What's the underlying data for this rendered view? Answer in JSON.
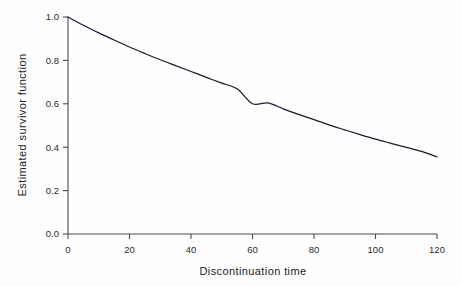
{
  "chart_data": {
    "type": "line",
    "title": "",
    "subtitle": "",
    "xlabel": "Discontinuation time",
    "ylabel": "Estimated survivor function",
    "xlim": [
      0,
      120
    ],
    "ylim": [
      0.0,
      1.0
    ],
    "xticks": [
      0,
      20,
      40,
      60,
      80,
      100,
      120
    ],
    "xtick_labels": [
      "0",
      "20",
      "40",
      "60",
      "80",
      "100",
      "120"
    ],
    "yticks": [
      0.0,
      0.2,
      0.4,
      0.6,
      0.8,
      1.0
    ],
    "ytick_labels": [
      "0.0",
      "0.2",
      "0.4",
      "0.6",
      "0.8",
      "1.0"
    ],
    "grid": false,
    "legend": null,
    "legend_position": "none",
    "series": [
      {
        "name": "Estimated survivor function",
        "color": "#1a1a2e",
        "x": [
          0,
          5,
          10,
          15,
          20,
          25,
          30,
          35,
          40,
          45,
          50,
          55,
          60,
          65,
          70,
          75,
          80,
          85,
          90,
          95,
          100,
          105,
          110,
          115,
          120
        ],
        "y": [
          1.0,
          0.962,
          0.927,
          0.894,
          0.862,
          0.832,
          0.803,
          0.776,
          0.749,
          0.722,
          0.695,
          0.669,
          0.6,
          0.604,
          0.577,
          0.551,
          0.527,
          0.502,
          0.48,
          0.458,
          0.437,
          0.418,
          0.399,
          0.381,
          0.355
        ]
      }
    ],
    "annotations": [],
    "axis_color": "#4a4a4a",
    "background_color": "#fefefe",
    "tick_direction": "out"
  },
  "figure": {
    "caption": "",
    "name": "estimated-survivor-function-plot"
  }
}
